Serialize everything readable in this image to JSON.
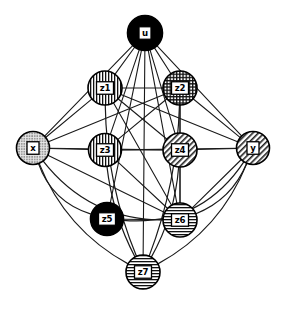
{
  "figure": {
    "kind": "graph-diagram",
    "title": "",
    "background_color": "#ffffff",
    "edge_color": "#1a1a1a",
    "width": 285,
    "height": 319
  },
  "nodes": [
    {
      "id": "u",
      "label": "u",
      "cx": 145,
      "cy": 33,
      "r": 17.5,
      "fill_style": "solid-black",
      "fill_color": "#000000",
      "label_box": true
    },
    {
      "id": "x",
      "label": "x",
      "cx": 33,
      "cy": 148,
      "r": 16.5,
      "fill_style": "stipple-gray",
      "fill_color": "#b9b9b9",
      "label_box": true
    },
    {
      "id": "y",
      "label": "y",
      "cx": 253,
      "cy": 148,
      "r": 16.5,
      "fill_style": "diagonal",
      "fill_color": "#d8d8d8",
      "label_box": true
    },
    {
      "id": "z1",
      "label": "z1",
      "cx": 105,
      "cy": 88,
      "r": 17.0,
      "fill_style": "vertical",
      "fill_color": "#ffffff",
      "label_box": true
    },
    {
      "id": "z2",
      "label": "z2",
      "cx": 180,
      "cy": 88,
      "r": 17.0,
      "fill_style": "crosshatch",
      "fill_color": "#ffffff",
      "label_box": true
    },
    {
      "id": "z3",
      "label": "z3",
      "cx": 105,
      "cy": 150,
      "r": 16.5,
      "fill_style": "vertical",
      "fill_color": "#ffffff",
      "label_box": true
    },
    {
      "id": "z4",
      "label": "z4",
      "cx": 180,
      "cy": 150,
      "r": 17.0,
      "fill_style": "diagonal",
      "fill_color": "#e0e0e0",
      "label_box": true
    },
    {
      "id": "z5",
      "label": "z5",
      "cx": 107,
      "cy": 219,
      "r": 16.5,
      "fill_style": "solid-black",
      "fill_color": "#000000",
      "label_box": true
    },
    {
      "id": "z6",
      "label": "z6",
      "cx": 180,
      "cy": 220,
      "r": 17.0,
      "fill_style": "horizontal",
      "fill_color": "#ffffff",
      "label_box": true
    },
    {
      "id": "z7",
      "label": "z7",
      "cx": 143,
      "cy": 272,
      "r": 17.0,
      "fill_style": "horizontal",
      "fill_color": "#ffffff",
      "label_box": true
    }
  ],
  "straight_edges": [
    [
      "u",
      "x"
    ],
    [
      "u",
      "y"
    ],
    [
      "u",
      "z1"
    ],
    [
      "u",
      "z2"
    ],
    [
      "u",
      "z3"
    ],
    [
      "u",
      "z4"
    ],
    [
      "u",
      "z5"
    ],
    [
      "u",
      "z6"
    ],
    [
      "u",
      "z7"
    ],
    [
      "x",
      "z1"
    ],
    [
      "x",
      "z2"
    ],
    [
      "x",
      "z3"
    ],
    [
      "x",
      "z4"
    ],
    [
      "x",
      "z6"
    ],
    [
      "y",
      "z1"
    ],
    [
      "y",
      "z2"
    ],
    [
      "y",
      "z3"
    ],
    [
      "y",
      "z4"
    ],
    [
      "y",
      "z6"
    ],
    [
      "z1",
      "z2"
    ],
    [
      "z1",
      "z4"
    ],
    [
      "z1",
      "z6"
    ],
    [
      "z2",
      "z3"
    ],
    [
      "z2",
      "z4"
    ],
    [
      "z2",
      "z6"
    ],
    [
      "z3",
      "z4"
    ],
    [
      "z3",
      "z6"
    ],
    [
      "z4",
      "z6"
    ],
    [
      "z5",
      "z6"
    ]
  ],
  "curved_edges": [
    {
      "from": "x",
      "to": "z5",
      "bow": 26
    },
    {
      "from": "x",
      "to": "z7",
      "bow": 30
    },
    {
      "from": "x",
      "to": "z6",
      "bow": 40
    },
    {
      "from": "y",
      "to": "z7",
      "bow": -30
    },
    {
      "from": "y",
      "to": "z6",
      "bow": -22
    },
    {
      "from": "y",
      "to": "z5",
      "bow": -48
    },
    {
      "from": "z1",
      "to": "z7",
      "bow": 18
    },
    {
      "from": "z2",
      "to": "z7",
      "bow": -16
    },
    {
      "from": "z4",
      "to": "z7",
      "bow": -14
    },
    {
      "from": "z3",
      "to": "z7",
      "bow": 12
    }
  ],
  "legend": {
    "pattern_names": {
      "solid-black": "solid black fill",
      "stipple-gray": "stippled gray fill",
      "diagonal": "diagonal hatch fill",
      "vertical": "vertical stripe fill",
      "horizontal": "horizontal stripe fill",
      "crosshatch": "crosshatch grid fill"
    }
  }
}
